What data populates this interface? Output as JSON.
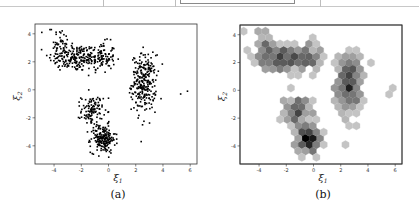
{
  "chart_data": [
    {
      "type": "scatter",
      "title": "",
      "caption": "(a)",
      "xlabel": "ξ",
      "xlabel_sub": "1",
      "ylabel": "ξ",
      "ylabel_sub": "2",
      "xlim": [
        -5.4,
        6.5
      ],
      "ylim": [
        -5.3,
        4.7
      ],
      "xticks": [
        -4,
        -2,
        0,
        2,
        4,
        6
      ],
      "yticks": [
        -4,
        -2,
        0,
        2,
        4
      ],
      "xtick_labels": [
        "-4",
        "-2",
        "0",
        "2",
        "4",
        "6"
      ],
      "ytick_labels": [
        "-4",
        "-2",
        "0",
        "2",
        "4"
      ],
      "grid": false,
      "marker_color": "#000000",
      "clusters": [
        {
          "name": "arc-left",
          "center": [
            -2.6,
            2.3
          ],
          "spread": [
            0.9,
            0.5
          ],
          "n": 170
        },
        {
          "name": "arc-right",
          "center": [
            -0.6,
            2.3
          ],
          "spread": [
            0.55,
            0.55
          ],
          "n": 120
        },
        {
          "name": "arc-top-left",
          "center": [
            -3.5,
            3.3
          ],
          "spread": [
            0.4,
            0.45
          ],
          "n": 40
        },
        {
          "name": "right-blob",
          "center": [
            2.6,
            0.5
          ],
          "spread": [
            0.45,
            1.0
          ],
          "n": 260
        },
        {
          "name": "lower-upper",
          "center": [
            -1.2,
            -1.5
          ],
          "spread": [
            0.4,
            0.55
          ],
          "n": 110
        },
        {
          "name": "lower-lower",
          "center": [
            -0.4,
            -3.5
          ],
          "spread": [
            0.45,
            0.5
          ],
          "n": 190
        }
      ],
      "outliers": [
        [
          -4.9,
          4.1
        ],
        [
          -4.3,
          4.3
        ],
        [
          -4.2,
          4.3
        ],
        [
          5.3,
          -0.3
        ],
        [
          5.8,
          -0.1
        ],
        [
          2.4,
          -3.7
        ],
        [
          0.0,
          -0.6
        ],
        [
          2.5,
          -2.5
        ]
      ]
    },
    {
      "type": "heatmap",
      "subtype": "hexbin",
      "title": "",
      "caption": "(b)",
      "xlabel": "ξ",
      "xlabel_sub": "1",
      "ylabel": "ξ",
      "ylabel_sub": "2",
      "xlim": [
        -5.4,
        6.5
      ],
      "ylim": [
        -5.3,
        4.7
      ],
      "xticks": [
        -4,
        -2,
        0,
        2,
        4,
        6
      ],
      "yticks": [
        -4,
        -2,
        0,
        2,
        4
      ],
      "xtick_labels": [
        "-4",
        "-2",
        "0",
        "2",
        "4",
        "6"
      ],
      "ytick_labels": [
        "-4",
        "-2",
        "0",
        "2",
        "4"
      ],
      "grid": false,
      "colormap": "Greys",
      "note": "same data as (a), binned into hexagons; darker = more points"
    }
  ],
  "captions": {
    "a": "(a)",
    "b": "(b)"
  }
}
